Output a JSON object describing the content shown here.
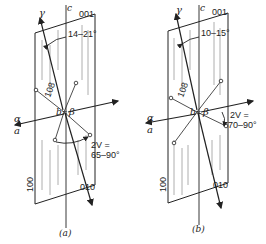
{
  "figure": {
    "panels": [
      {
        "id": "a",
        "caption": "(a)",
        "plane_top_label": "001",
        "plane_side_label": "100",
        "face_label": "010",
        "axis_c": "c",
        "axis_gamma": "γ",
        "axis_alpha_top": "α",
        "axis_alpha_bottom": "a",
        "axis_b": "b",
        "equals": "=",
        "axis_beta": "β",
        "plane_108": "108",
        "extinction_angle": "14–21°",
        "optic_angle_line1": "2V =",
        "optic_angle_line2": "65–90°"
      },
      {
        "id": "b",
        "caption": "(b)",
        "plane_top_label": "001",
        "plane_side_label": "100",
        "face_label": "010",
        "axis_c": "c",
        "axis_gamma": "γ",
        "axis_alpha_top": "α",
        "axis_alpha_bottom": "a",
        "axis_b": "b",
        "equals": "=",
        "axis_beta": "β",
        "plane_108": "108",
        "extinction_angle": "10–15°",
        "optic_angle_line1": "2V =",
        "optic_angle_line2": "70–90°"
      }
    ],
    "colors": {
      "ink": "#222222",
      "stripes": "#9a9a9a",
      "background": "#ffffff"
    }
  }
}
